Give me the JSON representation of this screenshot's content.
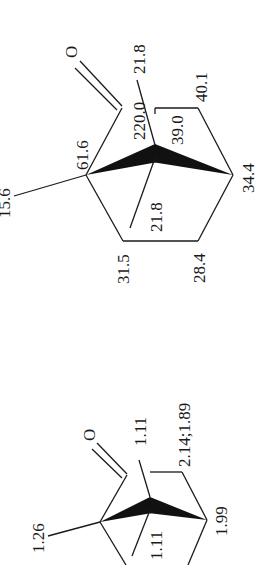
{
  "figure": {
    "colors": {
      "ink": "#1a1a1a",
      "background": "#ffffff"
    }
  },
  "top_structure": {
    "type": "13C shifts",
    "oxygen_label": "O",
    "labels": {
      "bridgehead_c1": "61.6",
      "carbonyl": "220.0",
      "methyl_c1": "15.6",
      "methyl_upper": "21.8",
      "methyl_lower": "21.8",
      "c7_bridge": "39.0",
      "ch2_next_carbonyl": "40.1",
      "bridgehead_c4": "34.4",
      "ch2_lower_left": "31.5",
      "ch2_lower_right": "28.4"
    }
  },
  "bottom_structure": {
    "type": "1H shifts",
    "oxygen_label": "O",
    "labels": {
      "methyl_c1": "1.26",
      "methyl_upper": "1.11",
      "methyl_lower": "1.11",
      "ch2_next_carbonyl": "2.14;1.89",
      "bridgehead_c4": "1.99"
    }
  }
}
